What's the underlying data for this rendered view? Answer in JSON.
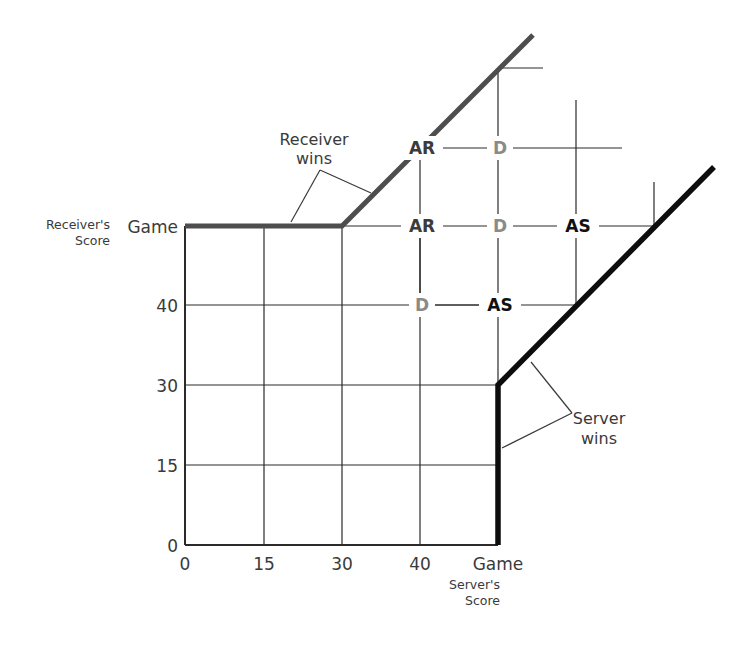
{
  "axes": {
    "x_title_line1": "Server's",
    "x_title_line2": "Score",
    "y_title_line1": "Receiver's",
    "y_title_line2": "Score",
    "x_ticks": [
      "0",
      "15",
      "30",
      "40",
      "Game"
    ],
    "y_ticks": [
      "0",
      "15",
      "30",
      "40",
      "Game"
    ]
  },
  "callouts": {
    "receiver_line1": "Receiver",
    "receiver_line2": "wins",
    "server_line1": "Server",
    "server_line2": "wins"
  },
  "states": [
    {
      "label": "AR",
      "meaning": "Advantage Receiver",
      "col": 3,
      "row": 5
    },
    {
      "label": "D",
      "meaning": "Deuce",
      "col": 4,
      "row": 5
    },
    {
      "label": "AR",
      "meaning": "Advantage Receiver",
      "col": 3,
      "row": 4
    },
    {
      "label": "D",
      "meaning": "Deuce",
      "col": 4,
      "row": 4
    },
    {
      "label": "AS",
      "meaning": "Advantage Server",
      "col": 5,
      "row": 4
    },
    {
      "label": "D",
      "meaning": "Deuce",
      "col": 3,
      "row": 3
    },
    {
      "label": "AS",
      "meaning": "Advantage Server",
      "col": 4,
      "row": 3
    }
  ],
  "colors": {
    "grid": "#2a2a2a",
    "receiver_line": "#4d4d4d",
    "server_line": "#0d0d0d",
    "state_AR": "#3b3b3b",
    "state_AS": "#111111",
    "state_D": "#8a8a8a"
  }
}
